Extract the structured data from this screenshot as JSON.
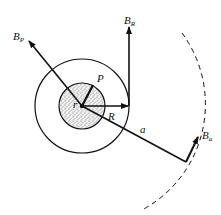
{
  "diagram": {
    "type": "physics-field-geometry",
    "colors": {
      "stroke": "#111111",
      "fill_inner": "#d8d8d8",
      "background": "#ffffff"
    },
    "labels": {
      "b_p": {
        "main": "B",
        "sub": "P"
      },
      "b_r": {
        "main": "B",
        "sub": "R"
      },
      "b_a": {
        "main": "B",
        "sub": "a"
      },
      "p": "P",
      "r_small": "r",
      "r_big": "R",
      "a": "a"
    }
  }
}
